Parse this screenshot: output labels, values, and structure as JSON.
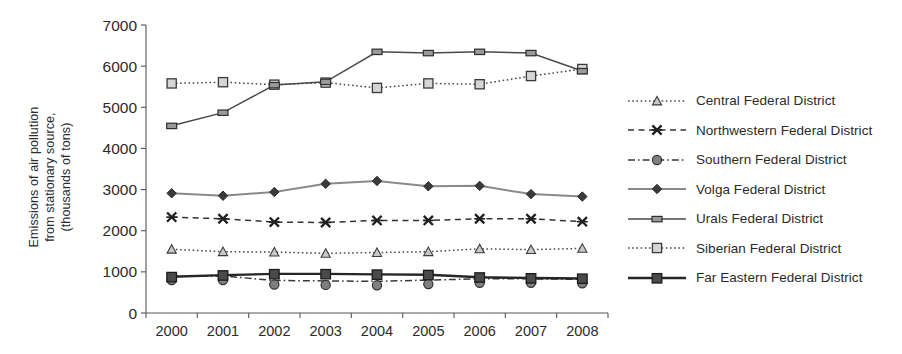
{
  "chart_data": {
    "type": "line",
    "title": "",
    "xlabel": "",
    "ylabel": "Emissions of air pollution from stationary source, (thousands of tons)",
    "ylabel_lines": [
      "Emissions of air pollution",
      "from stationary source,",
      "(thousands of tons)"
    ],
    "categories": [
      "2000",
      "2001",
      "2002",
      "2003",
      "2004",
      "2005",
      "2006",
      "2007",
      "2008"
    ],
    "x": [
      2000,
      2001,
      2002,
      2003,
      2004,
      2005,
      2006,
      2007,
      2008
    ],
    "ylim": [
      0,
      7000
    ],
    "yticks": [
      0,
      1000,
      2000,
      3000,
      4000,
      5000,
      6000,
      7000
    ],
    "ytick_labels": [
      "0",
      "1000",
      "2000",
      "3000",
      "4000",
      "5000",
      "6000",
      "7000"
    ],
    "grid": false,
    "legend_position": "right",
    "series": [
      {
        "name": "Central Federal District",
        "marker": "triangle",
        "dash": "dotted",
        "color": "#4a4a4a",
        "values": [
          1550,
          1490,
          1480,
          1450,
          1470,
          1490,
          1560,
          1540,
          1570
        ]
      },
      {
        "name": "Northwestern Federal District",
        "marker": "x",
        "dash": "dashed",
        "color": "#333333",
        "values": [
          2330,
          2290,
          2210,
          2200,
          2250,
          2250,
          2290,
          2290,
          2220
        ]
      },
      {
        "name": "Southern Federal District",
        "marker": "circle",
        "dash": "dash-dot",
        "color": "#3a3a3a",
        "values": [
          900,
          900,
          790,
          780,
          770,
          800,
          830,
          830,
          820
        ]
      },
      {
        "name": "Volga Federal District",
        "marker": "diamond",
        "dash": "solid",
        "color": "#8a8a8a",
        "values": [
          2910,
          2850,
          2940,
          3140,
          3210,
          3080,
          3090,
          2890,
          2830
        ]
      },
      {
        "name": "Urals Federal District",
        "marker": "small-square",
        "dash": "solid",
        "color": "#4a4a4a",
        "values": [
          4550,
          4870,
          5540,
          5620,
          6350,
          6320,
          6350,
          6320,
          5880
        ]
      },
      {
        "name": "Siberian Federal District",
        "marker": "square",
        "dash": "dotted",
        "color": "#4a4a4a",
        "values": [
          5580,
          5610,
          5550,
          5600,
          5470,
          5580,
          5560,
          5760,
          5930
        ]
      },
      {
        "name": "Far Eastern Federal District",
        "marker": "square-filled",
        "dash": "solid",
        "color": "#262626",
        "values": [
          880,
          920,
          950,
          950,
          940,
          930,
          870,
          850,
          840
        ]
      }
    ]
  },
  "legend": {
    "items": [
      {
        "label": "Central Federal District"
      },
      {
        "label": "Northwestern Federal District"
      },
      {
        "label": "Southern Federal District"
      },
      {
        "label": "Volga Federal District"
      },
      {
        "label": "Urals Federal District"
      },
      {
        "label": "Siberian Federal District"
      },
      {
        "label": "Far Eastern Federal District"
      }
    ]
  }
}
